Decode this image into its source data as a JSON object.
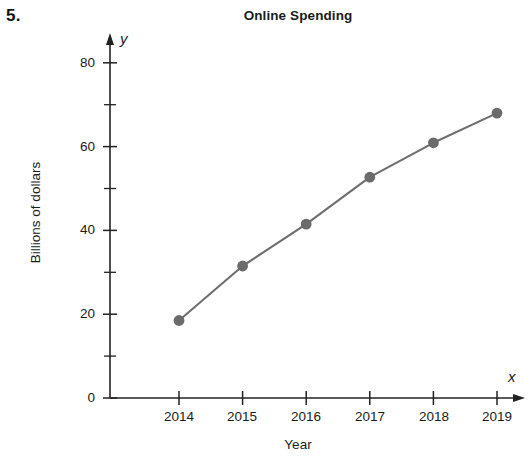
{
  "problem": {
    "number": "5."
  },
  "chart_data": {
    "type": "line",
    "title": "Online Spending",
    "xlabel": "Year",
    "ylabel": "Billions of dollars",
    "x_axis_letter": "x",
    "y_axis_letter": "y",
    "categories": [
      "2014",
      "2015",
      "2016",
      "2017",
      "2018",
      "2019"
    ],
    "x": [
      2014,
      2015,
      2016,
      2017,
      2018,
      2019
    ],
    "values": [
      18.5,
      31.5,
      41.5,
      52.7,
      60.9,
      68.0
    ],
    "series": [
      {
        "name": "Online Spending",
        "values": [
          18.5,
          31.5,
          41.5,
          52.7,
          60.9,
          68.0
        ]
      }
    ],
    "xlim": [
      2013.5,
      2019.5
    ],
    "ylim": [
      0,
      85
    ],
    "y_ticks_major": [
      0,
      20,
      40,
      60,
      80
    ],
    "y_ticks_minor": [
      10,
      30,
      50,
      70
    ],
    "y_tick_labels": [
      "0",
      "20",
      "40",
      "60",
      "80"
    ],
    "x_tick_labels": [
      "2014",
      "2015",
      "2016",
      "2017",
      "2018",
      "2019"
    ],
    "grid": false,
    "legend": "none",
    "marker": "filled-circle",
    "line_color": "#6e6e6e",
    "marker_color": "#6b6b6b",
    "axis_color": "#222222"
  }
}
